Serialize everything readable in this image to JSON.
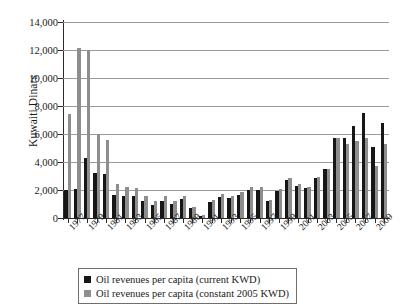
{
  "chart_data": {
    "type": "bar",
    "title": "",
    "xlabel": "",
    "ylabel": "Kuwaiti Dinars",
    "ylim": [
      0,
      14000
    ],
    "ytick_step": 2000,
    "ytick_labels": [
      "14,000",
      "12,000",
      "10,000",
      "8,000",
      "6,000",
      "4,000",
      "2,000",
      "0"
    ],
    "ytick_values": [
      14000,
      12000,
      10000,
      8000,
      6000,
      4000,
      2000,
      0
    ],
    "grid": true,
    "legend_position": "bottom-center",
    "colors": {
      "current": "#161616",
      "constant": "#8e8e8e",
      "gridline": "#9a9a9a",
      "axis": "#2b2b2b"
    },
    "categories": [
      "1977",
      "1978",
      "1979",
      "1980",
      "1981",
      "1982",
      "1983",
      "1984",
      "1985",
      "1986",
      "1987",
      "1988",
      "1989",
      "1990",
      "1991",
      "1992",
      "1993",
      "1994",
      "1995",
      "1996",
      "1997",
      "1998",
      "1999",
      "2000",
      "2001",
      "2002",
      "2003",
      "2004",
      "2005",
      "2006",
      "2007",
      "2008",
      "2009",
      "2010"
    ],
    "xtick_labels": [
      "1977",
      "1979",
      "1981",
      "1983",
      "1985",
      "1987",
      "1989",
      "1991",
      "1993",
      "1995",
      "1997",
      "1999",
      "2001",
      "2003",
      "2005",
      "2007",
      "2009"
    ],
    "series": [
      {
        "name": "Oil revenues per capita (current KWD)",
        "color": "#161616",
        "values": [
          2000,
          2050,
          4300,
          3250,
          3150,
          1650,
          1600,
          1600,
          1200,
          950,
          1200,
          1000,
          1350,
          700,
          150,
          1150,
          1500,
          1400,
          1650,
          2000,
          2000,
          1200,
          1900,
          2700,
          2300,
          2150,
          2850,
          3500,
          5700,
          5750,
          6600,
          7500,
          5100,
          6800
        ]
      },
      {
        "name": "Oil revenues per capita (constant 2005 KWD)",
        "color": "#8e8e8e",
        "values": [
          7400,
          12150,
          12000,
          6000,
          5600,
          2400,
          2200,
          2150,
          1600,
          1250,
          1550,
          1250,
          1600,
          800,
          180,
          1300,
          1700,
          1600,
          1850,
          2250,
          2200,
          1300,
          2050,
          2850,
          2400,
          2250,
          2900,
          3500,
          5700,
          5300,
          5500,
          5700,
          3700,
          5300
        ]
      }
    ]
  },
  "legend": {
    "items": [
      {
        "label": "Oil revenues per capita (current KWD)",
        "color": "#161616"
      },
      {
        "label": "Oil revenues per capita (constant 2005 KWD)",
        "color": "#8e8e8e"
      }
    ]
  }
}
